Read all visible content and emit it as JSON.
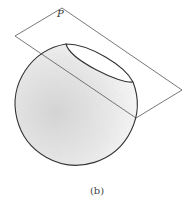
{
  "figure": {
    "plane_label": "P",
    "caption": "(b)",
    "colors": {
      "line": "#333333",
      "shading": "#e8e8e8",
      "background": "#ffffff"
    }
  }
}
